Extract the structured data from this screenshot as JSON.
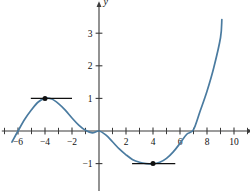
{
  "chart_data": {
    "type": "line",
    "title": "",
    "xlabel": "x",
    "ylabel": "y",
    "xlim": [
      -7.2,
      11.2
    ],
    "ylim": [
      -1.9,
      3.9
    ],
    "grid": false,
    "legend": null,
    "xticks": [
      -6,
      -4,
      -2,
      2,
      4,
      6,
      8,
      10
    ],
    "xticklabels": [
      "−6",
      "−4",
      "−2",
      "2",
      "4",
      "6",
      "8",
      "10"
    ],
    "yticks": [
      -1,
      1,
      2,
      3
    ],
    "yticklabels": [
      "−1",
      "1",
      "2",
      "3"
    ],
    "x_minor_ticks": [
      -7,
      -5,
      -3,
      -1,
      1,
      3,
      5,
      7,
      9,
      11
    ],
    "series": [
      {
        "name": "cubic curve",
        "color": "#4a7ba0",
        "x_domain": [
          -6.45,
          9.1
        ],
        "points": [
          [
            -6.45,
            -0.34
          ],
          [
            -6.0,
            0.0
          ],
          [
            -5.5,
            0.36
          ],
          [
            -5.0,
            0.65
          ],
          [
            -4.5,
            0.89
          ],
          [
            -4.0,
            1.0
          ],
          [
            -3.5,
            0.98
          ],
          [
            -3.0,
            0.84
          ],
          [
            -2.5,
            0.64
          ],
          [
            -2.0,
            0.4
          ],
          [
            -1.5,
            0.18
          ],
          [
            -1.0,
            0.02
          ],
          [
            -0.5,
            -0.06
          ],
          [
            0.0,
            0.0
          ],
          [
            0.5,
            -0.12
          ],
          [
            1.0,
            -0.33
          ],
          [
            1.5,
            -0.55
          ],
          [
            2.0,
            -0.73
          ],
          [
            2.5,
            -0.88
          ],
          [
            3.0,
            -0.96
          ],
          [
            3.5,
            -1.0
          ],
          [
            4.0,
            -1.01
          ],
          [
            4.5,
            -0.96
          ],
          [
            5.0,
            -0.84
          ],
          [
            5.5,
            -0.64
          ],
          [
            6.0,
            -0.38
          ],
          [
            6.5,
            -0.1
          ],
          [
            7.0,
            0.04
          ],
          [
            7.5,
            0.62
          ],
          [
            8.0,
            1.22
          ],
          [
            8.5,
            1.94
          ],
          [
            9.0,
            2.86
          ],
          [
            9.1,
            3.42
          ]
        ]
      }
    ],
    "marked_points": [
      {
        "label": "local maximum",
        "x": -4,
        "y": 1,
        "color": "#101010"
      },
      {
        "label": "local minimum",
        "x": 4,
        "y": -1,
        "color": "#101010"
      }
    ],
    "tangent_lines": [
      {
        "label": "horizontal tangent at local maximum",
        "y": 1,
        "x_start": -5.05,
        "x_end": -2.0,
        "color": "#101010"
      },
      {
        "label": "horizontal tangent at local minimum",
        "y": -1,
        "x_start": 2.45,
        "x_end": 5.65,
        "color": "#101010"
      }
    ],
    "colors": {
      "curve": "#4a7ba0",
      "axis": "#3a3a3a",
      "text": "#101010",
      "background": "#ffffff"
    }
  }
}
